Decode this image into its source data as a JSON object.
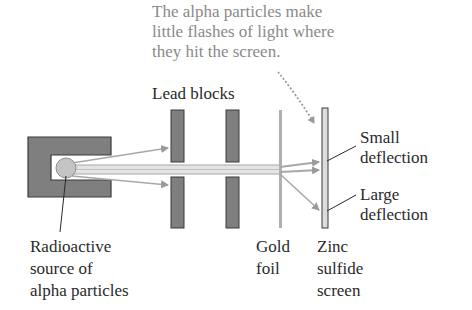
{
  "caption": {
    "lines": [
      "The alpha particles make",
      "little flashes of light where",
      "they hit the screen."
    ]
  },
  "labels": {
    "lead_blocks": "Lead blocks",
    "small_deflection": [
      "Small",
      "deflection"
    ],
    "large_deflection": [
      "Large",
      "deflection"
    ],
    "source": [
      "Radioactive",
      "source of",
      "alpha particles"
    ],
    "gold_foil": [
      "Gold",
      "foil"
    ],
    "screen": [
      "Zinc",
      "sulfide",
      "screen"
    ]
  },
  "colors": {
    "block_fill": "#7f7f7f",
    "block_stroke": "#3a3a3a",
    "beam": "#a8a8a8",
    "foil": "#b0b0b0",
    "source_ball": "#c4c4c4",
    "caption_text": "#8a8a8a",
    "label_text": "#2a2a2a"
  }
}
